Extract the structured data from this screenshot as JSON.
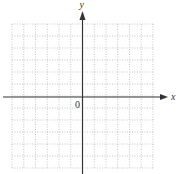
{
  "diagram": {
    "type": "coordinate-grid",
    "x_axis_label": "x",
    "y_axis_label": "y",
    "origin_label": "0",
    "grid": {
      "columns": 12,
      "rows": 12,
      "origin_column_index": 6,
      "origin_row_index": 6,
      "line_style": "dotted"
    },
    "colors": {
      "axis": "#333333",
      "grid": "#b8b8b8",
      "background": "#ffffff"
    }
  }
}
